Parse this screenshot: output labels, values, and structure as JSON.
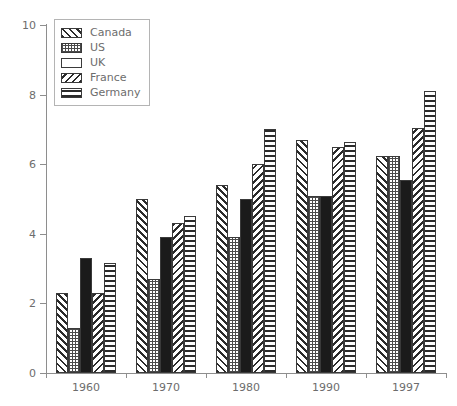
{
  "chart_data": {
    "type": "bar",
    "title": "",
    "xlabel": "",
    "ylabel": "",
    "categories": [
      "1960",
      "1970",
      "1980",
      "1990",
      "1997"
    ],
    "ylim": [
      0,
      10
    ],
    "yticks": [
      0,
      2,
      4,
      6,
      8,
      10
    ],
    "grid": false,
    "legend_position": "upper-left",
    "series": [
      {
        "name": "Canada",
        "pattern": "diagonal-hatch-right",
        "values": [
          2.3,
          5.0,
          5.4,
          6.7,
          6.25
        ]
      },
      {
        "name": "US",
        "pattern": "dotted",
        "values": [
          1.3,
          2.7,
          3.9,
          5.1,
          6.25
        ]
      },
      {
        "name": "UK",
        "pattern": "solid-black",
        "values": [
          3.3,
          3.9,
          5.0,
          5.1,
          5.55
        ]
      },
      {
        "name": "France",
        "pattern": "diagonal-hatch-left",
        "values": [
          2.3,
          4.3,
          6.0,
          6.5,
          7.05
        ]
      },
      {
        "name": "Germany",
        "pattern": "horizontal-lines",
        "values": [
          3.15,
          4.5,
          7.0,
          6.65,
          8.1
        ]
      }
    ]
  },
  "legend": {
    "items": [
      {
        "label": "Canada"
      },
      {
        "label": "US"
      },
      {
        "label": "UK"
      },
      {
        "label": "France"
      },
      {
        "label": "Germany"
      }
    ]
  },
  "axes": {
    "y_tick_labels": [
      "0",
      "2",
      "4",
      "6",
      "8",
      "10"
    ],
    "x_tick_labels": [
      "1960",
      "1970",
      "1980",
      "1990",
      "1997"
    ]
  },
  "colors": {
    "axis": "#8e8e8e",
    "text": "#6d6d6d",
    "bar_outline": "#3a3a3a",
    "bar_ink": "#2b2b2b",
    "solid_fill": "#1b1b1b",
    "legend_border": "#b4b4b4",
    "background": "#ffffff"
  }
}
